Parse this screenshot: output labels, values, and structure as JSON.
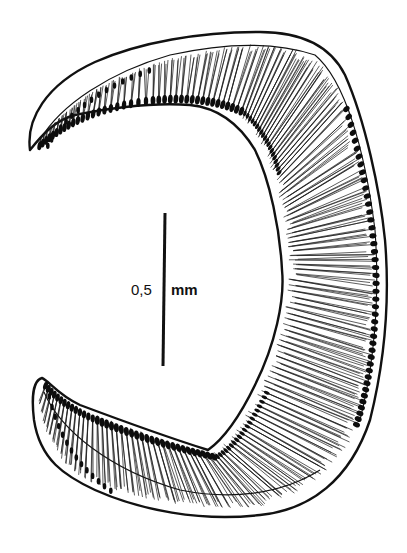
{
  "figure": {
    "colors": {
      "ink": "#111111",
      "background": "#ffffff"
    },
    "scale_bar": {
      "value": "0,5",
      "unit": "mm"
    }
  }
}
